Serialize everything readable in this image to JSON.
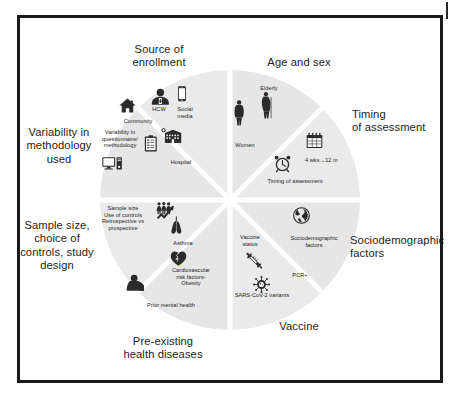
{
  "figure": {
    "type": "pie-diagram",
    "title_visible": false,
    "frame_color": "#1a1a1a",
    "wheel": {
      "center_x": 230,
      "center_y": 200,
      "radius": 130,
      "segment_fill": "#e9e9e9",
      "segment_fill_alt": "#e3e3e3",
      "gap_color": "#ffffff",
      "segment_count": 8
    }
  },
  "outer_labels": [
    {
      "id": "source",
      "text": "Source of\nenrollment"
    },
    {
      "id": "age",
      "text": "Age and sex"
    },
    {
      "id": "timing",
      "text": "Timing\nof assessment"
    },
    {
      "id": "socio",
      "text": "Sociodemographic\nfactors"
    },
    {
      "id": "vaccine",
      "text": "Vaccine"
    },
    {
      "id": "preexisting",
      "text": "Pre-existing\nhealth diseases"
    },
    {
      "id": "sample",
      "text": "Sample size,\nchoice of\ncontrols, study\ndesign"
    },
    {
      "id": "variability",
      "text": "Variability in\nmethodology\nused"
    }
  ],
  "segments": [
    {
      "id": "source-of-enrollment",
      "outer_label": "Source of\nenrollment",
      "inner_labels": [
        "HCW",
        "Social\nmedia",
        "Community",
        "Hospital"
      ],
      "icons": [
        "healthcare-worker-icon",
        "smartphone-icon",
        "house-icon",
        "hospital-icon"
      ]
    },
    {
      "id": "age-and-sex",
      "outer_label": "Age and sex",
      "inner_labels": [
        "Elderly",
        "Women"
      ],
      "icons": [
        "elderly-person-icon",
        "woman-icon"
      ]
    },
    {
      "id": "timing-of-assessment",
      "outer_label": "Timing\nof assessment",
      "inner_labels": [
        "4 wks→12 m",
        "Timing of assessment"
      ],
      "icons": [
        "calendar-icon",
        "alarm-clock-icon"
      ]
    },
    {
      "id": "sociodemographic-factors",
      "outer_label": "Sociodemographic\nfactors",
      "inner_labels": [
        "Sociodemographic\nfactors"
      ],
      "icons": [
        "globe-icon"
      ]
    },
    {
      "id": "vaccine",
      "outer_label": "Vaccine",
      "inner_labels": [
        "Vaccine\nstatus",
        "PCR+",
        "SARS-CoV-2 variants"
      ],
      "icons": [
        "syringe-icon",
        "virus-icon"
      ]
    },
    {
      "id": "pre-existing-health-diseases",
      "outer_label": "Pre-existing\nhealth diseases",
      "inner_labels": [
        "Asthma",
        "Cardiovascular\nrisk factors-\nObesity",
        "Prior mental health"
      ],
      "icons": [
        "lungs-icon",
        "heart-icon",
        "depressed-person-icon"
      ]
    },
    {
      "id": "sample-size-controls-design",
      "outer_label": "Sample size,\nchoice of\ncontrols, study\ndesign",
      "inner_labels": [
        "Sample size\nUse of controls\nRetrospective vs\nprospective"
      ],
      "icons": [
        "people-growth-chart-icon"
      ]
    },
    {
      "id": "variability-in-methodology",
      "outer_label": "Variability in\nmethodology\nused",
      "inner_labels": [
        "Variability in\nquestionnaire/\nmethodology"
      ],
      "icons": [
        "clipboard-icon",
        "computer-icon"
      ]
    }
  ],
  "inner_labels": {
    "hcw": "HCW",
    "social_media": "Social\nmedia",
    "community": "Community",
    "hospital": "Hospital",
    "questionnaire": "Variability in\nquestionnaire/\nmethodology",
    "sample_size": "Sample size\nUse of controls\nRetrospective vs\nprospective",
    "asthma": "Asthma",
    "cardiovascular": "Cardiovascular\nrisk factors-\nObesity",
    "prior_mental_health": "Prior mental health",
    "elderly": "Elderly",
    "women": "Women",
    "timing_of_assessment": "Timing of assessment",
    "four_wks": "4 wks→12 m",
    "sociodemographic": "Sociodemographic\nfactors",
    "vaccine_status": "Vaccine\nstatus",
    "pcr": "PCR+",
    "sars_cov_2": "SARS-CoV-2 variants"
  }
}
